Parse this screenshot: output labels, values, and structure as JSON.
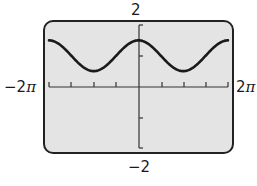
{
  "chart_data": {
    "type": "line",
    "title": "",
    "xlabel": "",
    "ylabel": "",
    "function": "y = 1 + 0.5 cos(x)",
    "xlim": [
      "-2π",
      "2π"
    ],
    "ylim": [
      -2,
      2
    ],
    "window_labels": {
      "xmin": "−2π",
      "xmax": "2π",
      "ymin": "−2",
      "ymax": "2"
    },
    "x_tick_step": "π/2",
    "y_tick_step": 1,
    "grid": false,
    "series": [
      {
        "name": "curve",
        "x": [
          "-2π",
          "-3π/2",
          "-π",
          "-π/2",
          "0",
          "π/2",
          "π",
          "3π/2",
          "2π"
        ],
        "values": [
          1.5,
          1.0,
          0.5,
          1.0,
          1.5,
          1.0,
          0.5,
          1.0,
          1.5
        ]
      }
    ]
  },
  "labels": {
    "ymax": "2",
    "ymin": "−2",
    "xmin_num": "−2",
    "xmin_pi": "π",
    "xmax_num": "2",
    "xmax_pi": "π"
  },
  "colors": {
    "screen_bg": "#e4e4e4",
    "frame": "#222222",
    "curve": "#1a1a1a",
    "axis": "#333333"
  }
}
